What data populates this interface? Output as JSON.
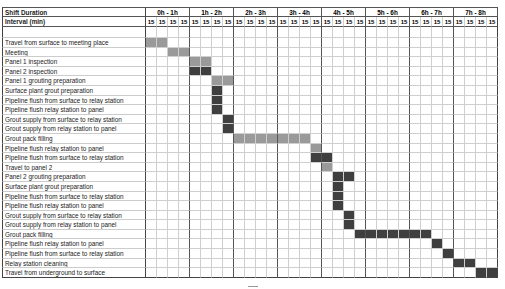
{
  "chart_data": {
    "type": "gantt",
    "title": "",
    "header": {
      "row1_label": "Shift Duration",
      "row2_label": "Interval (min)",
      "hours": [
        "0h - 1h",
        "1h - 2h",
        "2h - 3h",
        "3h - 4h",
        "4h - 5h",
        "5h - 6h",
        "6h - 7h",
        "7h - 8h"
      ],
      "interval_value": "15",
      "intervals_per_hour": 4
    },
    "colors": {
      "light": "#9a9a9a",
      "dark": "#3f3f3f"
    },
    "tasks": [
      {
        "name": "Travel from surface to meeting place",
        "start": 0,
        "end": 1,
        "shade": "light"
      },
      {
        "name": "Meeting",
        "start": 2,
        "end": 3,
        "shade": "light"
      },
      {
        "name": "Panel 1 inspection",
        "start": 4,
        "end": 5,
        "shade": "light"
      },
      {
        "name": "Panel 2 inspection",
        "start": 4,
        "end": 5,
        "shade": "dark"
      },
      {
        "name": "Panel 1 grouting preparation",
        "start": 6,
        "end": 7,
        "shade": "light"
      },
      {
        "name": "Surface plant grout preparation",
        "start": 6,
        "end": 6,
        "shade": "dark"
      },
      {
        "name": "Pipeline flush from surface to relay station",
        "start": 6,
        "end": 6,
        "shade": "dark"
      },
      {
        "name": "Pipeline flush relay station to panel",
        "start": 6,
        "end": 6,
        "shade": "dark"
      },
      {
        "name": "Grout supply from surface to relay station",
        "start": 7,
        "end": 7,
        "shade": "dark"
      },
      {
        "name": "Grout supply from relay station to panel",
        "start": 7,
        "end": 7,
        "shade": "dark"
      },
      {
        "name": "Grout pack filling",
        "start": 8,
        "end": 14,
        "shade": "light"
      },
      {
        "name": "Pipeline flush relay station to panel",
        "start": 15,
        "end": 15,
        "shade": "light"
      },
      {
        "name": "Pipeline flush  from surface to relay station",
        "start": 15,
        "end": 16,
        "shade": "dark"
      },
      {
        "name": "Travel to panel 2",
        "start": 16,
        "end": 16,
        "shade": "light"
      },
      {
        "name": "Panel 2 grouting preparation",
        "start": 17,
        "end": 18,
        "shade": "dark"
      },
      {
        "name": "Surface plant grout preparation",
        "start": 17,
        "end": 17,
        "shade": "dark"
      },
      {
        "name": "Pipeline flush from surface to relay station",
        "start": 17,
        "end": 17,
        "shade": "dark"
      },
      {
        "name": "Pipeline flush relay station to panel",
        "start": 17,
        "end": 17,
        "shade": "dark"
      },
      {
        "name": "Grout supply from surface to relay station",
        "start": 18,
        "end": 18,
        "shade": "dark"
      },
      {
        "name": "Grout supply from relay station to panel",
        "start": 18,
        "end": 18,
        "shade": "dark"
      },
      {
        "name": "Grout pack filling",
        "start": 19,
        "end": 25,
        "shade": "dark"
      },
      {
        "name": "Pipeline flush relay station to panel",
        "start": 26,
        "end": 26,
        "shade": "dark"
      },
      {
        "name": "Pipeline flush from surface to relay station",
        "start": 27,
        "end": 27,
        "shade": "dark"
      },
      {
        "name": "Relay station cleaning",
        "start": 28,
        "end": 29,
        "shade": "dark"
      },
      {
        "name": "Travel from underground to surface",
        "start": 30,
        "end": 31,
        "shade": "dark"
      }
    ],
    "xlabel": "Shift Duration (15-min intervals)",
    "ylabel": "",
    "grid": true
  }
}
